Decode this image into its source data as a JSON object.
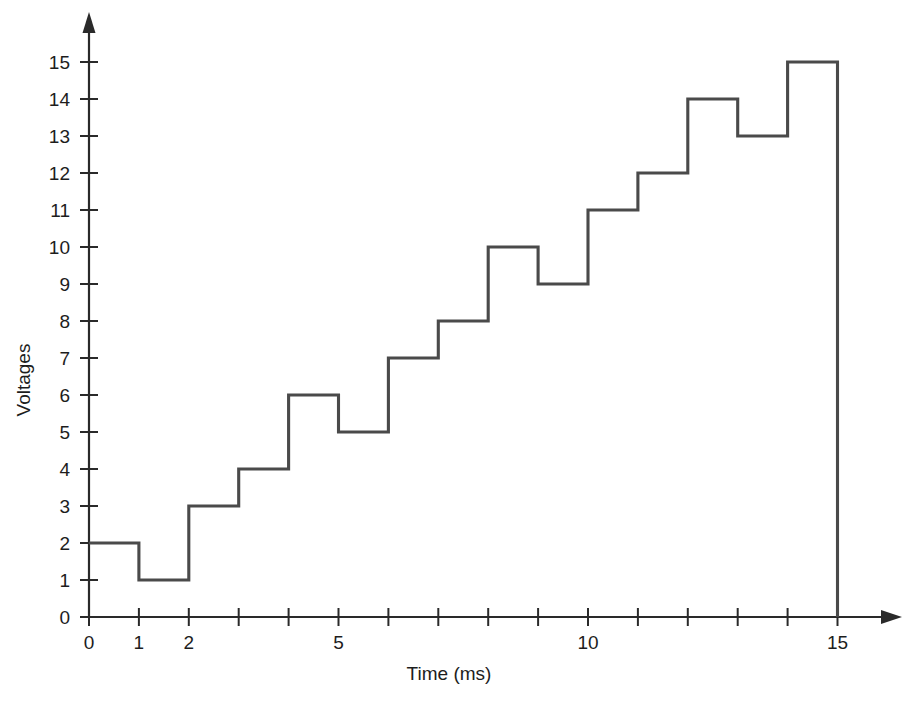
{
  "chart_data": {
    "type": "line",
    "step": "post",
    "title": "",
    "subtitle": "",
    "xlabel": "Time (ms)",
    "ylabel": "Voltages",
    "grid": false,
    "legend": false,
    "legend_position": "none",
    "x": [
      0,
      1,
      2,
      3,
      4,
      5,
      6,
      7,
      8,
      9,
      10,
      11,
      12,
      13,
      14,
      15
    ],
    "values": [
      2,
      1,
      3,
      4,
      6,
      5,
      7,
      8,
      10,
      9,
      11,
      12,
      14,
      13,
      15,
      0
    ],
    "series": [
      {
        "name": "Voltages",
        "values": [
          2,
          1,
          3,
          4,
          6,
          5,
          7,
          8,
          10,
          9,
          11,
          12,
          14,
          13,
          15,
          0
        ]
      }
    ],
    "xlim": [
      0,
      15
    ],
    "ylim": [
      0,
      15
    ],
    "x_tick_values": [
      0,
      1,
      2,
      3,
      4,
      5,
      6,
      7,
      8,
      9,
      10,
      11,
      12,
      13,
      14,
      15
    ],
    "x_tick_labels": [
      "0",
      "1",
      "2",
      "",
      "",
      "5",
      "",
      "",
      "",
      "",
      "10",
      "",
      "",
      "",
      "",
      "15"
    ],
    "y_tick_values": [
      0,
      1,
      2,
      3,
      4,
      5,
      6,
      7,
      8,
      9,
      10,
      11,
      12,
      13,
      14,
      15
    ],
    "y_tick_labels": [
      "0",
      "1",
      "2",
      "3",
      "4",
      "5",
      "6",
      "7",
      "8",
      "9",
      "10",
      "11",
      "12",
      "13",
      "14",
      "15"
    ],
    "annotations": [],
    "colors": {
      "line": "#4a4a4a",
      "axis": "#2a2a2a",
      "text": "#1d1d1d",
      "background": "#ffffff"
    }
  },
  "axes": {
    "x_axis_name": "x-axis",
    "y_axis_name": "y-axis",
    "x_arrow": "arrow-right",
    "y_arrow": "arrow-up"
  }
}
